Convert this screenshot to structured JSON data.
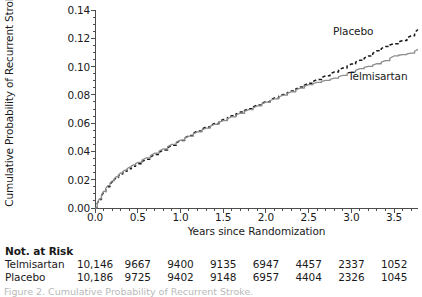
{
  "figure": {
    "caption_clipped": "Figure 2. Cumulative Probability of Recurrent Stroke."
  },
  "chart_data": {
    "type": "line",
    "title": "",
    "xlabel": "Years since Randomization",
    "ylabel": "Cumulative Probability of Recurrent Stroke",
    "xlim": [
      0.0,
      3.78
    ],
    "ylim": [
      0.0,
      0.14
    ],
    "grid": false,
    "legend_position": "inline-right",
    "x_ticks": [
      "0.0",
      "0.5",
      "1.0",
      "1.5",
      "2.0",
      "2.5",
      "3.0",
      "3.5"
    ],
    "x_tick_values": [
      0.0,
      0.5,
      1.0,
      1.5,
      2.0,
      2.5,
      3.0,
      3.5
    ],
    "x_minor_tick_step": 0.1,
    "y_ticks": [
      "0.00",
      "0.02",
      "0.04",
      "0.06",
      "0.08",
      "0.10",
      "0.12",
      "0.14"
    ],
    "y_tick_values": [
      0.0,
      0.02,
      0.04,
      0.06,
      0.08,
      0.1,
      0.12,
      0.14
    ],
    "y_minor_tick_step": 0.005,
    "series": [
      {
        "name": "Placebo",
        "style": "dashed",
        "color": "#1a1a1a",
        "x": [
          0.0,
          0.05,
          0.1,
          0.15,
          0.2,
          0.25,
          0.3,
          0.35,
          0.4,
          0.45,
          0.5,
          0.6,
          0.7,
          0.8,
          0.9,
          1.0,
          1.1,
          1.2,
          1.3,
          1.4,
          1.5,
          1.6,
          1.7,
          1.8,
          1.9,
          2.0,
          2.1,
          2.2,
          2.3,
          2.4,
          2.5,
          2.6,
          2.7,
          2.8,
          2.9,
          3.0,
          3.1,
          3.2,
          3.3,
          3.4,
          3.5,
          3.6,
          3.7,
          3.78
        ],
        "y": [
          0.0,
          0.006,
          0.011,
          0.015,
          0.0185,
          0.0215,
          0.024,
          0.026,
          0.0278,
          0.0295,
          0.0312,
          0.0345,
          0.0378,
          0.041,
          0.0443,
          0.0478,
          0.0512,
          0.0545,
          0.0572,
          0.0598,
          0.0625,
          0.0652,
          0.0678,
          0.0702,
          0.0728,
          0.0752,
          0.0778,
          0.0802,
          0.0828,
          0.0855,
          0.0882,
          0.0908,
          0.0935,
          0.0962,
          0.099,
          0.1018,
          0.1045,
          0.1075,
          0.1112,
          0.1142,
          0.1162,
          0.1185,
          0.1218,
          0.1262
        ]
      },
      {
        "name": "Telmisartan",
        "style": "solid",
        "color": "#8c8c8c",
        "x": [
          0.0,
          0.05,
          0.1,
          0.15,
          0.2,
          0.25,
          0.3,
          0.35,
          0.4,
          0.45,
          0.5,
          0.6,
          0.7,
          0.8,
          0.9,
          1.0,
          1.1,
          1.2,
          1.3,
          1.4,
          1.5,
          1.6,
          1.7,
          1.8,
          1.9,
          2.0,
          2.1,
          2.2,
          2.3,
          2.4,
          2.5,
          2.6,
          2.7,
          2.8,
          2.9,
          3.0,
          3.1,
          3.2,
          3.3,
          3.4,
          3.5,
          3.6,
          3.7,
          3.78
        ],
        "y": [
          0.0,
          0.0065,
          0.0118,
          0.0158,
          0.0192,
          0.0222,
          0.0248,
          0.0268,
          0.0288,
          0.0305,
          0.0322,
          0.0355,
          0.0388,
          0.0418,
          0.045,
          0.048,
          0.0508,
          0.0538,
          0.0565,
          0.0592,
          0.0618,
          0.0645,
          0.067,
          0.0695,
          0.0722,
          0.0748,
          0.0772,
          0.0798,
          0.0822,
          0.0848,
          0.0872,
          0.0888,
          0.0902,
          0.0918,
          0.0938,
          0.0962,
          0.0985,
          0.1002,
          0.102,
          0.1042,
          0.1075,
          0.1085,
          0.1095,
          0.1122
        ]
      }
    ],
    "inline_labels": [
      {
        "text": "Placebo"
      },
      {
        "text": "Telmisartan"
      }
    ]
  },
  "at_risk": {
    "title": "Not. at Risk",
    "x_positions": [
      0.0,
      0.5,
      1.0,
      1.5,
      2.0,
      2.5,
      3.0,
      3.5
    ],
    "rows": [
      {
        "label": "Telmisartan",
        "values": [
          "10,146",
          "9667",
          "9400",
          "9135",
          "6947",
          "4457",
          "2337",
          "1052"
        ]
      },
      {
        "label": "Placebo",
        "values": [
          "10,186",
          "9725",
          "9402",
          "9148",
          "6957",
          "4404",
          "2326",
          "1045"
        ]
      }
    ]
  }
}
